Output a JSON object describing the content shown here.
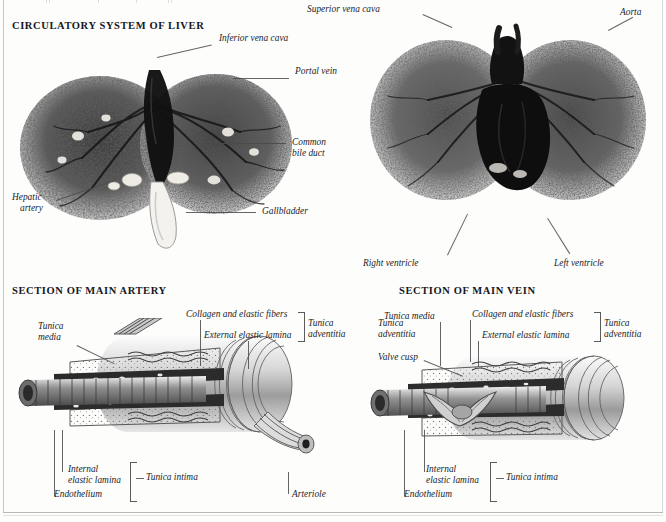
{
  "page": {
    "background": "#fdfdfc",
    "ink": "#20242b"
  },
  "sections": {
    "liver_title": "CIRCULATORY SYSTEM OF LIVER",
    "artery_title": "SECTION OF MAIN ARTERY",
    "vein_title": "SECTION OF MAIN VEIN"
  },
  "liver_left": {
    "labels": [
      {
        "key": "inferior_vena_cava",
        "text": "Inferior vena cava"
      },
      {
        "key": "portal_vein",
        "text": "Portal vein"
      },
      {
        "key": "common_bile_duct_1",
        "text": "Common"
      },
      {
        "key": "common_bile_duct_2",
        "text": "bile duct"
      },
      {
        "key": "gallbladder",
        "text": "Gallbladder"
      },
      {
        "key": "hepatic_artery_1",
        "text": "Hepatic"
      },
      {
        "key": "hepatic_artery_2",
        "text": "artery"
      }
    ]
  },
  "liver_right": {
    "labels": [
      {
        "key": "superior_vena_cava",
        "text": "Superior vena cava"
      },
      {
        "key": "aorta",
        "text": "Aorta"
      },
      {
        "key": "right_ventricle",
        "text": "Right ventricle"
      },
      {
        "key": "left_ventricle",
        "text": "Left ventricle"
      }
    ]
  },
  "artery": {
    "labels": [
      {
        "key": "tunica_media_1",
        "text": "Tunica"
      },
      {
        "key": "tunica_media_2",
        "text": "media"
      },
      {
        "key": "collagen",
        "text": "Collagen and elastic fibers"
      },
      {
        "key": "external_elastic_lamina",
        "text": "External elastic lamina"
      },
      {
        "key": "tunica_adventitia_1",
        "text": "Tunica"
      },
      {
        "key": "tunica_adventitia_2",
        "text": "adventitia"
      },
      {
        "key": "internal_elastic_lamina_1",
        "text": "Internal"
      },
      {
        "key": "internal_elastic_lamina_2",
        "text": "elastic lamina"
      },
      {
        "key": "tunica_intima",
        "text": "Tunica intima"
      },
      {
        "key": "endothelium",
        "text": "Endothelium"
      },
      {
        "key": "arteriole",
        "text": "Arteriole"
      }
    ]
  },
  "vein": {
    "labels": [
      {
        "key": "tunica_media",
        "text": "Tunica media"
      },
      {
        "key": "collagen",
        "text": "Collagen and elastic fibers"
      },
      {
        "key": "external_elastic_lamina",
        "text": "External elastic lamina"
      },
      {
        "key": "tunica_adventitia_left_1",
        "text": "Tunica"
      },
      {
        "key": "tunica_adventitia_left_2",
        "text": "adventitia"
      },
      {
        "key": "tunica_adventitia_right_1",
        "text": "Tunica"
      },
      {
        "key": "tunica_adventitia_right_2",
        "text": "adventitia"
      },
      {
        "key": "valve_cusp",
        "text": "Valve cusp"
      },
      {
        "key": "internal_elastic_lamina_1",
        "text": "Internal"
      },
      {
        "key": "internal_elastic_lamina_2",
        "text": "elastic lamina"
      },
      {
        "key": "tunica_intima",
        "text": "Tunica intima"
      },
      {
        "key": "endothelium",
        "text": "Endothelium"
      }
    ]
  }
}
